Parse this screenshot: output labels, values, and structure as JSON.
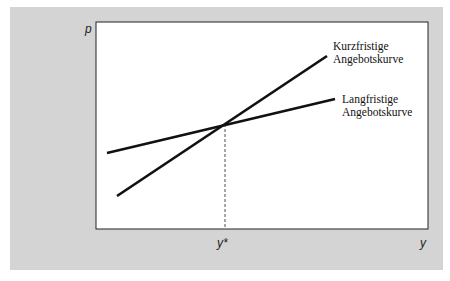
{
  "axes": {
    "y_label": "p",
    "x_label": "y",
    "x_marker": "y*"
  },
  "curves": {
    "short_run": {
      "label_line1": "Kurzfristige",
      "label_line2": "Angebotskurve"
    },
    "long_run": {
      "label_line1": "Langfristige",
      "label_line2": "Angebotskurve"
    }
  },
  "colors": {
    "background": "#d4d4d4",
    "plot": "#ffffff",
    "line": "#111111"
  }
}
